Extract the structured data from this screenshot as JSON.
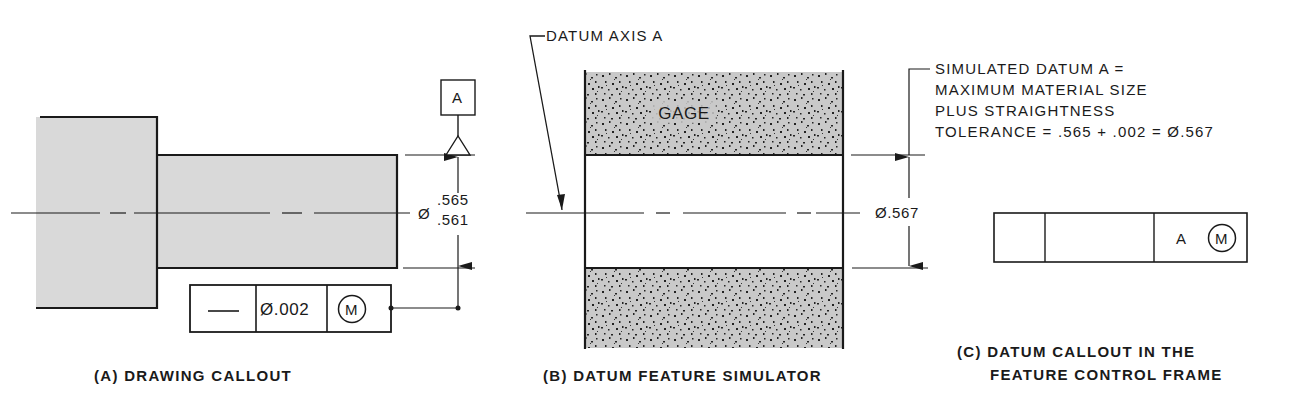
{
  "colors": {
    "ink": "#1a1a1a",
    "part_fill": "#d9d9d9",
    "gage_fill": "#c9c9c9",
    "background": "#ffffff"
  },
  "panel_a": {
    "caption": "(A) DRAWING CALLOUT",
    "datum_label": "A",
    "diameter_symbol": "Ø",
    "size_upper": ".565",
    "size_lower": ".561",
    "feature_control_frame": {
      "symbol": "straightness",
      "symbol_glyph": "—",
      "tolerance": "Ø.002",
      "modifier": "M"
    }
  },
  "panel_b": {
    "caption": "(B) DATUM FEATURE SIMULATOR",
    "datum_axis_label": "DATUM AXIS A",
    "gage_label": "GAGE",
    "diameter": "Ø.567",
    "note_lines": [
      "SIMULATED DATUM A =",
      "MAXIMUM MATERIAL SIZE",
      "PLUS STRAIGHTNESS",
      "TOLERANCE = .565 + .002 = Ø.567"
    ]
  },
  "panel_c": {
    "caption_lines": [
      "(C) DATUM CALLOUT IN THE",
      "FEATURE CONTROL FRAME"
    ],
    "frame": {
      "cell1": "",
      "cell2": "",
      "datum": "A",
      "modifier": "M"
    }
  }
}
